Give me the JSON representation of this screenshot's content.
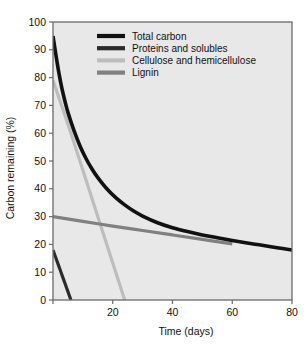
{
  "figure": {
    "background": "#ffffff",
    "plot_background": "#e8e8e8",
    "frame_color": "#6b6b6b"
  },
  "chart_data": {
    "type": "line",
    "title": "",
    "xlabel": "Time (days)",
    "ylabel": "Carbon remaining (%)",
    "xlim": [
      0,
      80
    ],
    "ylim": [
      0,
      100
    ],
    "xticks": [
      0,
      20,
      40,
      60,
      80
    ],
    "xtick_labels": [
      "",
      "20",
      "40",
      "60",
      "80"
    ],
    "yticks": [
      0,
      10,
      20,
      30,
      40,
      50,
      60,
      70,
      80,
      90,
      100
    ],
    "ytick_labels": [
      "0",
      "10",
      "20",
      "30",
      "40",
      "50",
      "60",
      "70",
      "80",
      "90",
      "100"
    ],
    "grid": false,
    "legend_position": "top-center",
    "series": [
      {
        "name": "Total carbon",
        "color": "#111111",
        "width": 3.6,
        "points": [
          [
            0,
            95
          ],
          [
            1,
            88
          ],
          [
            2,
            81.5
          ],
          [
            3,
            76
          ],
          [
            4,
            71.5
          ],
          [
            5,
            67.5
          ],
          [
            7,
            61
          ],
          [
            9,
            55.5
          ],
          [
            11,
            51
          ],
          [
            13,
            47.2
          ],
          [
            15,
            44
          ],
          [
            18,
            40
          ],
          [
            21,
            36.8
          ],
          [
            24,
            34.2
          ],
          [
            27,
            32
          ],
          [
            30,
            30.2
          ],
          [
            35,
            27.8
          ],
          [
            40,
            26
          ],
          [
            45,
            24.6
          ],
          [
            50,
            23.4
          ],
          [
            55,
            22.4
          ],
          [
            60,
            21.4
          ],
          [
            65,
            20.5
          ],
          [
            70,
            19.7
          ],
          [
            75,
            18.8
          ],
          [
            80,
            18
          ]
        ]
      },
      {
        "name": "Proteins and solubles",
        "color": "#2b2b2b",
        "width": 3.2,
        "points": [
          [
            0,
            18
          ],
          [
            1,
            15
          ],
          [
            2,
            12
          ],
          [
            3,
            9
          ],
          [
            4,
            6
          ],
          [
            5,
            3
          ],
          [
            6,
            0
          ]
        ]
      },
      {
        "name": "Cellulose and hemicellulose",
        "color": "#bdbdbd",
        "width": 3.2,
        "points": [
          [
            0,
            79
          ],
          [
            6,
            60
          ],
          [
            12,
            40
          ],
          [
            18,
            20
          ],
          [
            24,
            0
          ]
        ]
      },
      {
        "name": "Lignin",
        "color": "#808080",
        "width": 3.2,
        "points": [
          [
            0,
            30
          ],
          [
            10,
            28.3
          ],
          [
            20,
            26.6
          ],
          [
            30,
            25
          ],
          [
            40,
            23.4
          ],
          [
            50,
            21.8
          ],
          [
            60,
            20.2
          ]
        ]
      }
    ]
  },
  "legend": {
    "entries": [
      {
        "label": "Total carbon",
        "color": "#111111"
      },
      {
        "label": "Proteins and solubles",
        "color": "#2b2b2b"
      },
      {
        "label": "Cellulose and hemicellulose",
        "color": "#bdbdbd"
      },
      {
        "label": "Lignin",
        "color": "#808080"
      }
    ]
  }
}
